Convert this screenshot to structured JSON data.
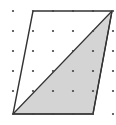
{
  "figure": {
    "type": "dot-grid-parallelogram",
    "grid": {
      "columns": [
        13,
        33,
        53,
        73,
        93,
        113
      ],
      "rows": [
        11,
        31,
        51,
        71,
        91,
        114
      ],
      "dot_color": "#444444",
      "dot_radius": 1.1
    },
    "parallelogram": {
      "points": "33,11 112,11 93,114 13,114",
      "stroke": "#333333",
      "stroke_width": 1.4
    },
    "shaded_triangle": {
      "points": "13,114 112,11 93,114",
      "fill": "#d4d4d4",
      "stroke": "#333333",
      "stroke_width": 1.2
    },
    "colors": {
      "background": "#ffffff",
      "line": "#333333",
      "shade": "#d4d4d4"
    }
  }
}
